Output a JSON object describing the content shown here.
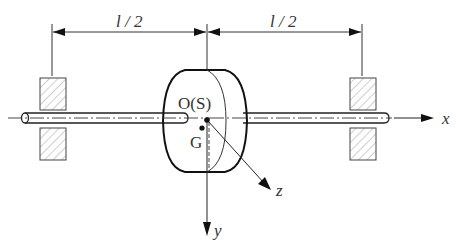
{
  "diagram": {
    "type": "rotor-shaft-schematic",
    "colors": {
      "stroke": "#222222",
      "hatch": "#888888",
      "background": "#ffffff"
    },
    "dimensions": [
      {
        "label": "l / 2",
        "from_x": 52,
        "to_x": 207
      },
      {
        "label": "l / 2",
        "from_x": 207,
        "to_x": 362
      }
    ],
    "labels": {
      "center": "O(S)",
      "mass_center": "G",
      "x_axis": "x",
      "y_axis": "y",
      "z_axis": "z"
    },
    "components": {
      "shaft": "shaft",
      "disk": "disk",
      "left_bearing": "bearing",
      "right_bearing": "bearing"
    }
  }
}
